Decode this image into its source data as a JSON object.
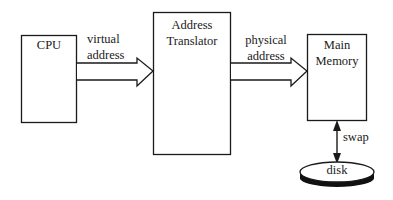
{
  "diagram": {
    "nodes": {
      "cpu": {
        "label": "CPU"
      },
      "translator": {
        "line1": "Address",
        "line2": "Translator"
      },
      "memory": {
        "line1": "Main",
        "line2": "Memory"
      },
      "disk": {
        "label": "disk"
      }
    },
    "edges": {
      "virtual": {
        "line1": "virtual",
        "line2": "address",
        "from": "CPU",
        "to": "Address Translator"
      },
      "physical": {
        "line1": "physical",
        "line2": "address",
        "from": "Address Translator",
        "to": "Main Memory"
      },
      "swap": {
        "label": "swap",
        "from": "Main Memory",
        "to": "disk",
        "bidirectional": true
      }
    },
    "colors": {
      "stroke": "#1a1a1a",
      "background": "#ffffff",
      "disk_base": "#111111"
    }
  }
}
